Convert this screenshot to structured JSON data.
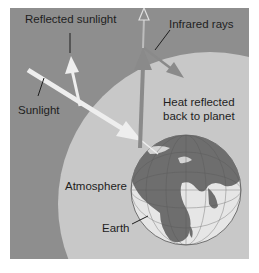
{
  "diagram": {
    "labels": {
      "reflected_sunlight": "Reflected sunlight",
      "sunlight": "Sunlight",
      "infrared_rays": "Infrared rays",
      "heat_reflected_line1": "Heat reflected",
      "heat_reflected_line2": "back to planet",
      "atmosphere": "Atmosphere",
      "earth": "Earth"
    },
    "colors": {
      "space": "#8e8e8e",
      "atmosphere": "#c8c8c8",
      "earth_land": "#6e6e6e",
      "earth_ocean": "#e6e6e6",
      "sunlight_arrow": "#eeeeee",
      "infrared_arrow": "#8a8a8a",
      "text": "#1e1e1e",
      "background": "#ffffff"
    }
  }
}
